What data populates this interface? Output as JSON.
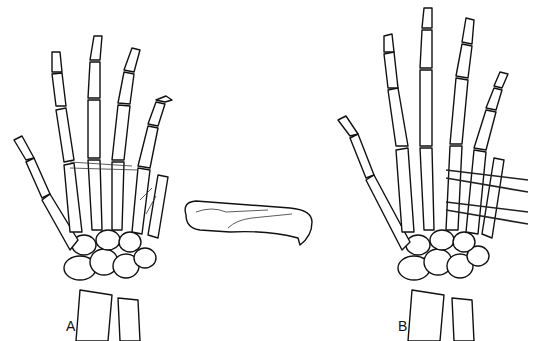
{
  "figure": {
    "panels": [
      {
        "id": "A",
        "label": "A",
        "description": "Hand skeleton dorsal view with fractured fifth metacarpal"
      },
      {
        "id": "B",
        "label": "B",
        "description": "Hand skeleton with percutaneous transverse K-wire fixation of fifth metacarpal"
      }
    ],
    "inset": {
      "description": "Isolated fifth metacarpal showing oblique fracture"
    }
  }
}
